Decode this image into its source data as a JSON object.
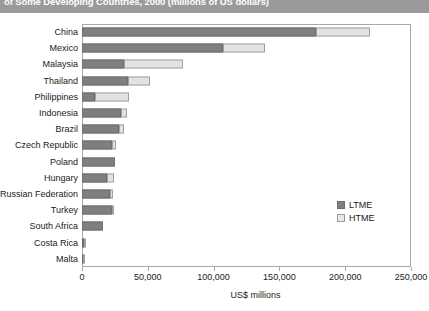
{
  "title": {
    "text": "of Some Developing Countries, 2000 (millions of US dollars)",
    "bar_color": "#9a9a9a"
  },
  "colors": {
    "ltme": "#7f7f7f",
    "htme": "#e2e2e2",
    "frame": "#a9a9a9",
    "text": "#1a1a1a"
  },
  "legend": {
    "position": "inside-right",
    "items": [
      {
        "label": "LTME",
        "color": "#7f7f7f"
      },
      {
        "label": "HTME",
        "color": "#e2e2e2"
      }
    ]
  },
  "chart_data": {
    "type": "bar",
    "orientation": "horizontal",
    "stacked": true,
    "title": "of Some Developing Countries, 2000 (millions of US dollars)",
    "xlabel": "US$ millions",
    "ylabel": "",
    "xlim": [
      0,
      250000
    ],
    "xticks": [
      0,
      50000,
      100000,
      150000,
      200000,
      250000
    ],
    "xtick_labels": [
      "0",
      "50,000",
      "100,000",
      "150,000",
      "200,000",
      "250,000"
    ],
    "grid": false,
    "categories": [
      "China",
      "Mexico",
      "Malaysia",
      "Thailand",
      "Philippines",
      "Indonesia",
      "Brazil",
      "Czech Republic",
      "Poland",
      "Hungary",
      "Russian Federation",
      "Turkey",
      "South Africa",
      "Costa Rica",
      "Malta"
    ],
    "series": [
      {
        "name": "LTME",
        "color": "#7f7f7f",
        "values": [
          178000,
          107000,
          32000,
          35000,
          10000,
          30000,
          28000,
          23000,
          25000,
          19000,
          21000,
          22500,
          16000,
          1500,
          900
        ]
      },
      {
        "name": "HTME",
        "color": "#e2e2e2",
        "values": [
          41000,
          32000,
          45000,
          17000,
          26000,
          4000,
          4000,
          2500,
          0,
          5000,
          2500,
          500,
          0,
          900,
          300
        ]
      }
    ],
    "totals": [
      219000,
      139000,
      77000,
      52000,
      36000,
      34000,
      32000,
      25500,
      25000,
      24000,
      23500,
      23000,
      16000,
      2400,
      1200
    ]
  }
}
